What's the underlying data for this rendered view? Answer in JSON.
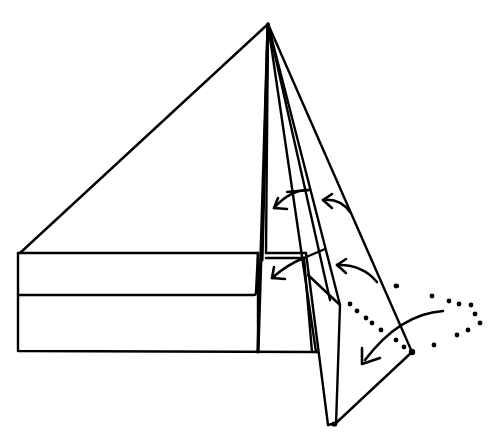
{
  "diagram": {
    "type": "origami-fold-diagram",
    "colors": {
      "line": "#000000",
      "background": "#ffffff"
    },
    "elements": {
      "apex": {
        "x": 268,
        "y": 24
      },
      "base_rectangle": {
        "x": 18,
        "y": 253,
        "width": 320,
        "height": 98
      },
      "fold_arrows": [
        {
          "label": "fold-arrow-upper-inner"
        },
        {
          "label": "fold-arrow-upper-outer"
        },
        {
          "label": "fold-arrow-lower-inner"
        },
        {
          "label": "fold-arrow-lower-outer"
        },
        {
          "label": "fold-arrow-curved-dotted"
        }
      ]
    }
  }
}
